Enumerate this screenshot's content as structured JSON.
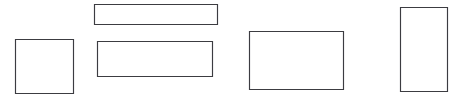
{
  "canvas": {
    "width": 459,
    "height": 100,
    "background_color": "#ffffff",
    "stroke_color": "#3c3c41",
    "stroke_width": 1.15,
    "shape_count": 5
  },
  "shapes": [
    {
      "name": "square-outline",
      "kind": "rectangle",
      "x": 15,
      "y": 39,
      "width": 58,
      "height": 54,
      "fill": "#ffffff",
      "stroke": "#3c3c41"
    },
    {
      "name": "thin-horizontal-bar-outline",
      "kind": "rectangle",
      "x": 94,
      "y": 4,
      "width": 123,
      "height": 20,
      "fill": "#ffffff",
      "stroke": "#3c3c41"
    },
    {
      "name": "wide-horizontal-rectangle-outline",
      "kind": "rectangle",
      "x": 97,
      "y": 41,
      "width": 115,
      "height": 35,
      "fill": "#ffffff",
      "stroke": "#3c3c41"
    },
    {
      "name": "landscape-rectangle-outline",
      "kind": "rectangle",
      "x": 249,
      "y": 31,
      "width": 94,
      "height": 58,
      "fill": "#ffffff",
      "stroke": "#3c3c41"
    },
    {
      "name": "portrait-rectangle-outline",
      "kind": "rectangle",
      "x": 400,
      "y": 7,
      "width": 47,
      "height": 84,
      "fill": "#ffffff",
      "stroke": "#3c3c41"
    }
  ]
}
